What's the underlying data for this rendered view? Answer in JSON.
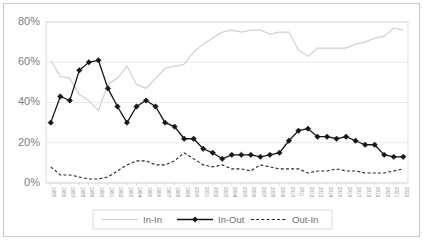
{
  "chart_data": {
    "type": "line",
    "title": "",
    "xlabel": "",
    "ylabel": "",
    "ylim": [
      0,
      80
    ],
    "ytick_labels": [
      "0%",
      "20%",
      "40%",
      "60%",
      "80%"
    ],
    "ytick_values": [
      0,
      20,
      40,
      60,
      80
    ],
    "grid": true,
    "legend_position": "bottom",
    "categories": [
      "1985",
      "1986",
      "1987",
      "1988",
      "1989",
      "1990",
      "1991",
      "1992",
      "1993",
      "1994",
      "1995",
      "1996",
      "1997",
      "1998",
      "1999",
      "2000",
      "2001",
      "2002",
      "2003",
      "2004",
      "2005",
      "2006",
      "2007",
      "2008",
      "2009",
      "2010",
      "2011",
      "2012",
      "2013",
      "2014",
      "2015",
      "2016",
      "2017",
      "2018",
      "2019",
      "2020",
      "2021",
      "2022"
    ],
    "series": [
      {
        "name": "In-In",
        "style": "solid-light",
        "color": "#d0d0d0",
        "marker": "none",
        "values": [
          61,
          53,
          52,
          44,
          41,
          36,
          49,
          52,
          58,
          49,
          47,
          52,
          57,
          58,
          59,
          65,
          69,
          72,
          75,
          76,
          75,
          76,
          76,
          74,
          75,
          75,
          66,
          63,
          67,
          67,
          67,
          67,
          69,
          70,
          72,
          73,
          77,
          76
        ]
      },
      {
        "name": "In-Out",
        "style": "solid-dark",
        "color": "#171717",
        "marker": "diamond",
        "values": [
          30,
          43,
          41,
          56,
          60,
          61,
          47,
          38,
          30,
          38,
          41,
          38,
          30,
          28,
          22,
          22,
          17,
          15,
          12,
          14,
          14,
          14,
          13,
          14,
          15,
          21,
          26,
          27,
          23,
          23,
          22,
          23,
          21,
          19,
          19,
          14,
          13,
          13
        ]
      },
      {
        "name": "Out-In",
        "style": "dashed",
        "color": "#242424",
        "marker": "none",
        "values": [
          8,
          4,
          4,
          3,
          2,
          2,
          3,
          6,
          9,
          11,
          11,
          9,
          9,
          11,
          15,
          12,
          9,
          8,
          9,
          7,
          7,
          6,
          9,
          8,
          7,
          7,
          7,
          5,
          6,
          6,
          7,
          6,
          6,
          5,
          5,
          5,
          6,
          7
        ]
      }
    ]
  },
  "legend": {
    "items": [
      {
        "label": "In-In"
      },
      {
        "label": "In-Out"
      },
      {
        "label": "Out-In"
      }
    ]
  }
}
